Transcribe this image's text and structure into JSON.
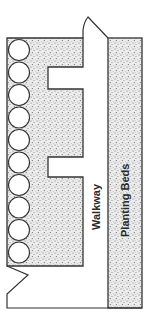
{
  "diagram": {
    "type": "garden-plan",
    "labels": {
      "walkway": "Walkway",
      "planting_beds": "Planting Beds"
    },
    "circles": {
      "count": 10,
      "label": "shrubs"
    },
    "colors": {
      "outline": "#333333",
      "stipple_bg": "#e9e9e9",
      "stipple_dot": "#6a6a6a",
      "path": "#ffffff"
    }
  }
}
